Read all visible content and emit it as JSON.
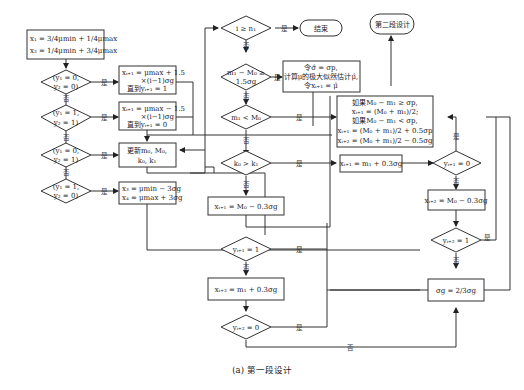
{
  "caption": "(a) 第一段设计",
  "labels": {
    "yes": "是",
    "no": "否"
  },
  "nodes": {
    "init": {
      "line1": "x₁ = 3/4μmin + 1/4μmax",
      "line2": "x₂ = 1/4μmin + 3/4μmax"
    },
    "d1": {
      "line1": "(y₁ = 0,",
      "line2": "y₂ = 0)"
    },
    "d2": {
      "line1": "(y₁ = 1,",
      "line2": "y₂ = 1)"
    },
    "d3": {
      "line1": "(y₁ = 0,",
      "line2": "y₂ = 1)"
    },
    "d4": {
      "line1": "(y₁ = 1,",
      "line2": "y₂ = 0)"
    },
    "p1": {
      "line1": "xᵢ₊₁ = μmax + 1.5",
      "line2": "×(i−1)σg",
      "line3": "直到yᵢ₊₁ = 1"
    },
    "p2": {
      "line1": "xᵢ₊₁ = μmax − 1.5",
      "line2": "×(i−1)σg",
      "line3": "直到yᵢ₊₁ = 0"
    },
    "p3": {
      "line1": "更新m₀, M₀,",
      "line2": "k₀, k₁"
    },
    "p4": {
      "line1": "x₃ = μmin − 3σg",
      "line2": "x₄ = μmax + 3σg"
    },
    "c1": {
      "text": "i ≥ n₁"
    },
    "end": {
      "text": "结束"
    },
    "c2": {
      "line1": "m₁ − M₀ ≥",
      "line2": "1.5σg"
    },
    "est": {
      "line1": "令σ̂ = σp,",
      "line2": "计算μ的极大似然估计μ̂,",
      "line3": "令xᵢ₊₁ = μ̂"
    },
    "c3": {
      "text": "m₁ < M₀"
    },
    "c4": {
      "text": "k₀ > k₁"
    },
    "p5": {
      "text": "xᵢ₊₁ = M₀ − 0.3σg"
    },
    "c5": {
      "text": "yᵢ₊₁ = 1"
    },
    "p6": {
      "text": "xᵢ₊₂ = m₁ + 0.3σg"
    },
    "c6": {
      "text": "yᵢ₊₂ = 0"
    },
    "stage2": {
      "text": "第二段设计"
    },
    "mid": {
      "line1": "如果M₀ − m₁ ≥ σp,",
      "line2": "xᵢ₊₁ = (M₀ + m₁)/2;",
      "line3": "如果M₀ − m₁ < σp,",
      "line4": "xᵢ₊₁ = (M₀ + m₁)/2 + 0.5σp",
      "line5": "xᵢ₊₂ = (M₀ + m₁)/2 − 0.5σg"
    },
    "p7": {
      "text": "xᵢ₊₁ = m₁ + 0.3σg"
    },
    "c7": {
      "text": "yᵢ₊₁ = 0"
    },
    "p8": {
      "text": "xᵢ₊₂ = M₀ − 0.3σg"
    },
    "c8": {
      "text": "yᵢ₊₂ = 1"
    },
    "sig": {
      "text": "σg = 2/3σg"
    }
  }
}
